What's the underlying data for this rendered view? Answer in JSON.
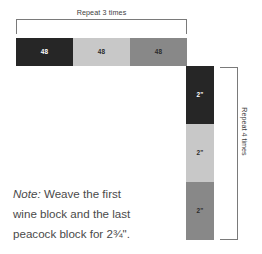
{
  "diagram": {
    "colors": {
      "wine": "#262626",
      "cream": "#c8c8c8",
      "peacock": "#888888",
      "bracket": "#7a7a7a",
      "label_text": "#3d3d3d",
      "note_text": "#4a4a4a",
      "light_label_text": "#2b2b2b",
      "dark_label_text": "#ffffff",
      "background": "#ffffff"
    }
  },
  "top_bracket": {
    "label": "Repeat 3 times"
  },
  "horizontal_strip": {
    "blocks": [
      {
        "label": "48",
        "color": "#262626",
        "text_color": "#ffffff",
        "name": "wine"
      },
      {
        "label": "48",
        "color": "#c8c8c8",
        "text_color": "#2b2b2b",
        "name": "cream"
      },
      {
        "label": "48",
        "color": "#888888",
        "text_color": "#2b2b2b",
        "name": "peacock"
      }
    ]
  },
  "vertical_strip": {
    "blocks": [
      {
        "label": "2\"",
        "color": "#262626",
        "text_color": "#ffffff",
        "name": "wine"
      },
      {
        "label": "2\"",
        "color": "#c8c8c8",
        "text_color": "#2b2b2b",
        "name": "cream"
      },
      {
        "label": "2\"",
        "color": "#888888",
        "text_color": "#2b2b2b",
        "name": "peacock"
      }
    ]
  },
  "right_bracket": {
    "label": "Repeat 4 times"
  },
  "note": {
    "lead": "Note:",
    "line1_rest": " Weave the first",
    "line2": "wine block and the last",
    "line3": "peacock block for 2¾\"."
  }
}
